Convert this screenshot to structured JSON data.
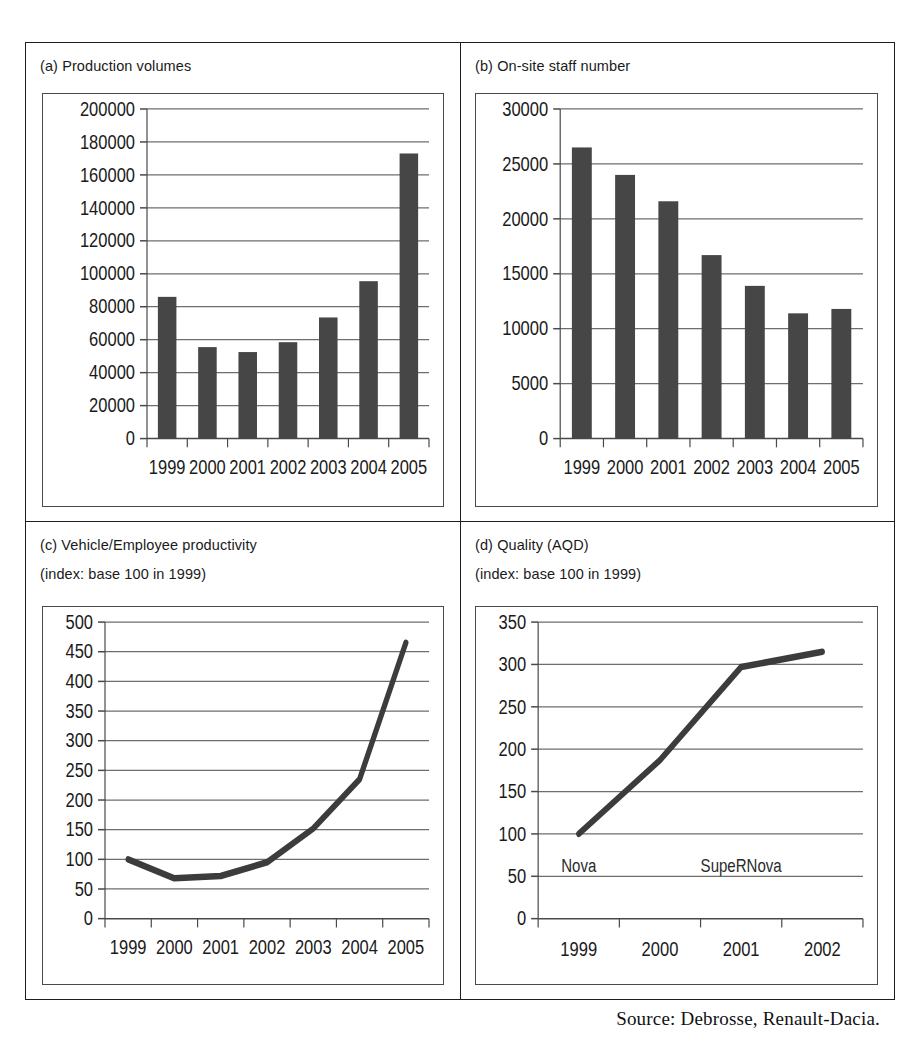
{
  "figure": {
    "source_note": "Source: Debrosse, Renault-Dacia."
  },
  "panels": {
    "a": {
      "title": "(a) Production volumes",
      "subtitle": ""
    },
    "b": {
      "title": "(b) On-site staff number",
      "subtitle": ""
    },
    "c": {
      "title": "(c) Vehicle/Employee productivity",
      "subtitle": "(index: base 100 in 1999)"
    },
    "d": {
      "title": "(d) Quality (AQD)",
      "subtitle": "(index: base 100 in 1999)"
    }
  },
  "chart_data": [
    {
      "id": "a",
      "type": "bar",
      "title": "(a) Production volumes",
      "xlabel": "",
      "ylabel": "",
      "categories": [
        "1999",
        "2000",
        "2001",
        "2002",
        "2003",
        "2004",
        "2005"
      ],
      "values": [
        86000,
        55500,
        52500,
        58500,
        73500,
        95500,
        173000
      ],
      "ylim": [
        0,
        200000
      ],
      "ytick_step": 20000,
      "ytick_labels": [
        "0",
        "20000",
        "40000",
        "60000",
        "80000",
        "100000",
        "120000",
        "140000",
        "160000",
        "180000",
        "200000"
      ],
      "grid": true,
      "legend": false,
      "bar_color": "#464646"
    },
    {
      "id": "b",
      "type": "bar",
      "title": "(b) On-site staff number",
      "xlabel": "",
      "ylabel": "",
      "categories": [
        "1999",
        "2000",
        "2001",
        "2002",
        "2003",
        "2004",
        "2005"
      ],
      "values": [
        26500,
        24000,
        21600,
        16700,
        13900,
        11400,
        11800
      ],
      "ylim": [
        0,
        30000
      ],
      "ytick_step": 5000,
      "ytick_labels": [
        "0",
        "5000",
        "10000",
        "15000",
        "20000",
        "25000",
        "30000"
      ],
      "grid": true,
      "legend": false,
      "bar_color": "#464646"
    },
    {
      "id": "c",
      "type": "line",
      "title": "(c) Vehicle/Employee productivity",
      "subtitle": "(index: base 100 in 1999)",
      "xlabel": "",
      "ylabel": "",
      "categories": [
        "1999",
        "2000",
        "2001",
        "2002",
        "2003",
        "2004",
        "2005"
      ],
      "values": [
        100,
        68,
        72,
        95,
        152,
        235,
        465
      ],
      "ylim": [
        0,
        500
      ],
      "ytick_step": 50,
      "ytick_labels": [
        "0",
        "50",
        "100",
        "150",
        "200",
        "250",
        "300",
        "350",
        "400",
        "450",
        "500"
      ],
      "grid": true,
      "legend": false,
      "line_color": "#3c3c3c"
    },
    {
      "id": "d",
      "type": "line",
      "title": "(d) Quality (AQD)",
      "subtitle": "(index: base 100 in 1999)",
      "xlabel": "",
      "ylabel": "",
      "categories": [
        "1999",
        "2000",
        "2001",
        "2002"
      ],
      "values": [
        100,
        187,
        297,
        315
      ],
      "ylim": [
        0,
        350
      ],
      "ytick_step": 50,
      "ytick_labels": [
        "0",
        "50",
        "100",
        "150",
        "200",
        "250",
        "300",
        "350"
      ],
      "grid": true,
      "legend": false,
      "line_color": "#3c3c3c",
      "annotations": [
        {
          "text": "Nova",
          "x_category": "1999",
          "y": 55
        },
        {
          "text": "SupeRNova",
          "x_category": "2001",
          "y": 55
        }
      ]
    }
  ]
}
